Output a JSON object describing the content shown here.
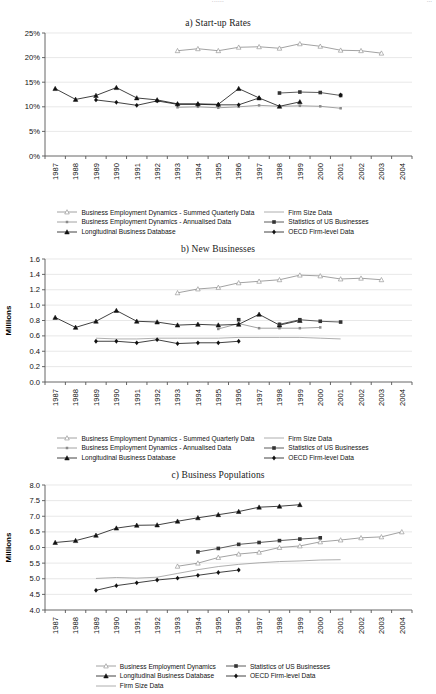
{
  "header": {
    "center": "......",
    "right": "..."
  },
  "series_styles": {
    "bed_summed": {
      "color": "#8a8a8a",
      "marker": "triangle-open"
    },
    "bed_annual": {
      "color": "#8a8a8a",
      "marker": "square-small"
    },
    "lbd": {
      "color": "#111111",
      "marker": "triangle-filled"
    },
    "firm_size": {
      "color": "#9a9a9a",
      "marker": "none"
    },
    "susb": {
      "color": "#333333",
      "marker": "square-filled"
    },
    "oecd": {
      "color": "#111111",
      "marker": "diamond-filled"
    },
    "bed_pop": {
      "color": "#8a8a8a",
      "marker": "triangle-open"
    }
  },
  "charts": [
    {
      "id": "startup-rates",
      "title": "a) Start-up Rates",
      "type": "line",
      "ylabel": "",
      "xlabel": "",
      "ylim": [
        0,
        25
      ],
      "yticks": [
        0,
        5,
        10,
        15,
        20,
        25
      ],
      "ytick_labels": [
        "0%",
        "5%",
        "10%",
        "15%",
        "20%",
        "25%"
      ],
      "x": [
        1987,
        1988,
        1989,
        1990,
        1991,
        1992,
        1993,
        1994,
        1995,
        1996,
        1997,
        1998,
        1999,
        2000,
        2001,
        2002,
        2003,
        2004
      ],
      "xtick_labels": [
        "1987",
        "1988",
        "1989",
        "1990",
        "1991",
        "1992",
        "1993",
        "1994",
        "1995",
        "1996",
        "1997",
        "1998",
        "1999",
        "2000",
        "2001",
        "2002",
        "2003",
        "2004"
      ],
      "grid": true,
      "series": [
        {
          "key": "bed_summed",
          "name": "Business Employment Dynamics - Summed Quarterly Data",
          "values": [
            null,
            null,
            null,
            null,
            null,
            null,
            21.4,
            21.8,
            21.4,
            22.1,
            22.2,
            21.9,
            22.8,
            22.3,
            21.5,
            21.4,
            20.9,
            null
          ]
        },
        {
          "key": "bed_annual",
          "name": "Business Employment Dynamics - Annualised Data",
          "values": [
            null,
            null,
            null,
            null,
            null,
            null,
            9.9,
            10.0,
            9.8,
            10.0,
            10.3,
            10.1,
            10.2,
            10.1,
            9.7,
            null,
            null,
            null
          ]
        },
        {
          "key": "lbd",
          "name": "Longitudinal Business Database",
          "values": [
            13.7,
            11.5,
            12.3,
            13.9,
            11.8,
            11.4,
            10.6,
            10.6,
            10.5,
            13.7,
            11.8,
            10.1,
            11.0,
            null,
            null,
            null,
            null,
            null
          ]
        },
        {
          "key": "firm_size",
          "name": "Firm Size Data",
          "values": [
            null,
            null,
            null,
            null,
            null,
            null,
            null,
            null,
            null,
            null,
            null,
            null,
            null,
            null,
            null,
            null,
            null,
            null
          ]
        },
        {
          "key": "susb",
          "name": "Statistics of US Businesses",
          "values": [
            null,
            null,
            null,
            null,
            null,
            null,
            null,
            null,
            null,
            null,
            null,
            12.8,
            13.0,
            12.9,
            12.3,
            null,
            null,
            null
          ]
        },
        {
          "key": "oecd",
          "name": "OECD Firm-level Data",
          "values": [
            null,
            null,
            11.4,
            10.9,
            10.3,
            11.2,
            10.5,
            10.5,
            10.4,
            10.4,
            11.8,
            null,
            null,
            null,
            12.4,
            null,
            null,
            null
          ]
        }
      ],
      "legend": [
        {
          "key": "bed_summed",
          "label": "Business Employment Dynamics - Summed Quarterly Data",
          "col": 0
        },
        {
          "key": "firm_size",
          "label": "Firm Size Data",
          "col": 1
        },
        {
          "key": "bed_annual",
          "label": "Business Employment Dynamics - Annualised Data",
          "col": 0
        },
        {
          "key": "susb",
          "label": "Statistics of US Businesses",
          "col": 1
        },
        {
          "key": "lbd",
          "label": "Longitudinal Business Database",
          "col": 0
        },
        {
          "key": "oecd",
          "label": "OECD Firm-level Data",
          "col": 1
        }
      ]
    },
    {
      "id": "new-businesses",
      "title": "b) New Businesses",
      "type": "line",
      "ylabel": "Millions",
      "xlabel": "",
      "ylim": [
        0.0,
        1.6
      ],
      "yticks": [
        0.0,
        0.2,
        0.4,
        0.6,
        0.8,
        1.0,
        1.2,
        1.4,
        1.6
      ],
      "ytick_labels": [
        "0.0",
        "0.2",
        "0.4",
        "0.6",
        "0.8",
        "1.0",
        "1.2",
        "1.4",
        "1.6"
      ],
      "x": [
        1987,
        1988,
        1989,
        1990,
        1991,
        1992,
        1993,
        1994,
        1995,
        1996,
        1997,
        1998,
        1999,
        2000,
        2001,
        2002,
        2003,
        2004
      ],
      "xtick_labels": [
        "1987",
        "1988",
        "1989",
        "1990",
        "1991",
        "1992",
        "1993",
        "1994",
        "1995",
        "1996",
        "1997",
        "1998",
        "1999",
        "2000",
        "2001",
        "2002",
        "2003",
        "2004"
      ],
      "grid": true,
      "series": [
        {
          "key": "bed_summed",
          "name": "Business Employment Dynamics - Summed Quarterly Data",
          "values": [
            null,
            null,
            null,
            null,
            null,
            null,
            1.16,
            1.21,
            1.23,
            1.29,
            1.31,
            1.33,
            1.39,
            1.38,
            1.34,
            1.35,
            1.33,
            null
          ]
        },
        {
          "key": "bed_annual",
          "name": "Business Employment Dynamics - Annualised Data",
          "values": [
            null,
            null,
            null,
            null,
            null,
            null,
            null,
            null,
            0.69,
            0.76,
            0.7,
            0.7,
            0.7,
            0.71,
            null,
            null,
            null,
            null
          ]
        },
        {
          "key": "lbd",
          "name": "Longitudinal Business Database",
          "values": [
            0.84,
            0.71,
            0.79,
            0.93,
            0.79,
            0.78,
            0.74,
            0.75,
            0.74,
            0.75,
            0.88,
            0.74,
            0.8,
            null,
            null,
            null,
            null,
            null
          ]
        },
        {
          "key": "firm_size",
          "name": "Firm Size Data",
          "values": [
            null,
            null,
            0.57,
            0.56,
            0.56,
            0.57,
            0.57,
            0.57,
            0.57,
            0.58,
            0.58,
            0.58,
            0.58,
            0.57,
            0.56,
            null,
            null,
            null
          ]
        },
        {
          "key": "susb",
          "name": "Statistics of US Businesses",
          "values": [
            null,
            null,
            null,
            null,
            null,
            null,
            null,
            null,
            null,
            0.81,
            null,
            0.75,
            0.81,
            0.79,
            0.78,
            null,
            null,
            null
          ]
        },
        {
          "key": "oecd",
          "name": "OECD Firm-level Data",
          "values": [
            null,
            null,
            0.53,
            0.53,
            0.51,
            0.55,
            0.5,
            0.51,
            0.51,
            0.53,
            null,
            null,
            null,
            null,
            null,
            null,
            null,
            null
          ]
        }
      ],
      "legend": [
        {
          "key": "bed_summed",
          "label": "Business Employment Dynamics - Summed Quarterly Data",
          "col": 0
        },
        {
          "key": "firm_size",
          "label": "Firm Size Data",
          "col": 1
        },
        {
          "key": "bed_annual",
          "label": "Business Employment Dynamics - Annualised Data",
          "col": 0
        },
        {
          "key": "susb",
          "label": "Statistics of US Businesses",
          "col": 1
        },
        {
          "key": "lbd",
          "label": "Longitudinal Business Database",
          "col": 0
        },
        {
          "key": "oecd",
          "label": "OECD Firm-level Data",
          "col": 1
        }
      ]
    },
    {
      "id": "business-populations",
      "title": "c) Business Populations",
      "type": "line",
      "ylabel": "Millions",
      "xlabel": "",
      "ylim": [
        4.0,
        8.0
      ],
      "yticks": [
        4.0,
        4.5,
        5.0,
        5.5,
        6.0,
        6.5,
        7.0,
        7.5,
        8.0
      ],
      "ytick_labels": [
        "4.0",
        "4.5",
        "5.0",
        "5.5",
        "6.0",
        "6.5",
        "7.0",
        "7.5",
        "8.0"
      ],
      "x": [
        1987,
        1988,
        1989,
        1990,
        1991,
        1992,
        1993,
        1994,
        1995,
        1996,
        1997,
        1998,
        1999,
        2000,
        2001,
        2002,
        2003,
        2004
      ],
      "xtick_labels": [
        "1987",
        "1988",
        "1989",
        "1990",
        "1991",
        "1992",
        "1993",
        "1994",
        "1995",
        "1996",
        "1997",
        "1998",
        "1999",
        "2000",
        "2001",
        "2002",
        "2003",
        "2004"
      ],
      "grid": true,
      "series": [
        {
          "key": "bed_pop",
          "name": "Business Employment Dynamics",
          "values": [
            null,
            null,
            null,
            null,
            null,
            null,
            5.4,
            5.5,
            5.68,
            5.79,
            5.85,
            6.0,
            6.05,
            6.18,
            6.24,
            6.31,
            6.34,
            6.5
          ]
        },
        {
          "key": "lbd",
          "name": "Longitudinal Business Database",
          "values": [
            6.16,
            6.22,
            6.39,
            6.62,
            6.71,
            6.72,
            6.84,
            6.95,
            7.05,
            7.15,
            7.29,
            7.32,
            7.37,
            null,
            null,
            null,
            null,
            null
          ]
        },
        {
          "key": "firm_size",
          "name": "Firm Size Data",
          "values": [
            null,
            null,
            5.01,
            5.04,
            5.02,
            5.05,
            5.17,
            5.29,
            5.39,
            5.46,
            5.51,
            5.55,
            5.57,
            5.6,
            5.61,
            null,
            null,
            null
          ]
        },
        {
          "key": "susb",
          "name": "Statistics of US Businesses",
          "values": [
            null,
            null,
            null,
            null,
            null,
            null,
            null,
            5.86,
            5.97,
            6.1,
            6.16,
            6.22,
            6.27,
            6.31,
            null,
            null,
            null,
            null
          ]
        },
        {
          "key": "oecd",
          "name": "OECD Firm-level Data",
          "values": [
            null,
            null,
            4.63,
            4.78,
            4.87,
            4.96,
            5.02,
            5.11,
            5.2,
            5.28,
            null,
            null,
            null,
            null,
            null,
            null,
            null,
            null
          ]
        }
      ],
      "legend": [
        {
          "key": "bed_pop",
          "label": "Business Employment Dynamics",
          "col": 0
        },
        {
          "key": "susb",
          "label": "Statistics of US Businesses",
          "col": 1
        },
        {
          "key": "lbd",
          "label": "Longitudinal Business Database",
          "col": 0
        },
        {
          "key": "oecd",
          "label": "OECD Firm-level Data",
          "col": 1
        },
        {
          "key": "firm_size",
          "label": "Firm Size Data",
          "col": 0
        }
      ]
    }
  ]
}
